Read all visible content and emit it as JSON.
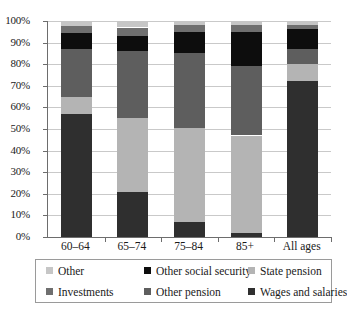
{
  "chart_data": {
    "type": "bar",
    "stacked": true,
    "title": "",
    "xlabel": "",
    "ylabel": "",
    "ylim": [
      0,
      100
    ],
    "grid": true,
    "legend_position": "bottom",
    "categories": [
      "60–64",
      "65–74",
      "75–84",
      "85+",
      "All ages"
    ],
    "ytick_labels": [
      "0%",
      "10%",
      "20%",
      "30%",
      "40%",
      "50%",
      "60%",
      "70%",
      "80%",
      "90%",
      "100%"
    ],
    "ytick_values": [
      0,
      10,
      20,
      30,
      40,
      50,
      60,
      70,
      80,
      90,
      100
    ],
    "series": [
      {
        "name": "Wages and salaries",
        "color": "#2f2f2f",
        "values": [
          57,
          21,
          7,
          2,
          72
        ]
      },
      {
        "name": "State pension",
        "color": "#b4b4b4",
        "values": [
          8,
          34,
          43.5,
          45,
          8
        ]
      },
      {
        "name": "Other pension",
        "color": "#5e5e5e",
        "values": [
          22,
          31,
          34.5,
          32,
          7
        ]
      },
      {
        "name": "Other social security",
        "color": "#0d0d0d",
        "values": [
          7.5,
          7,
          10,
          16,
          9.5
        ]
      },
      {
        "name": "Investments",
        "color": "#6f6f6f",
        "values": [
          3,
          4,
          3,
          3,
          1.5
        ]
      },
      {
        "name": "Other",
        "color": "#c6c6c6",
        "values": [
          2.5,
          3,
          2,
          2,
          2
        ]
      }
    ]
  },
  "legend": {
    "row1": [
      {
        "label": "Other",
        "color": "#c6c6c6"
      },
      {
        "label": "Other social security",
        "color": "#0d0d0d"
      },
      {
        "label": "State pension",
        "color": "#b4b4b4"
      }
    ],
    "row2": [
      {
        "label": "Investments",
        "color": "#6f6f6f"
      },
      {
        "label": "Other pension",
        "color": "#5e5e5e"
      },
      {
        "label": "Wages and salaries",
        "color": "#2f2f2f"
      }
    ]
  },
  "caption": {
    "text": ""
  }
}
